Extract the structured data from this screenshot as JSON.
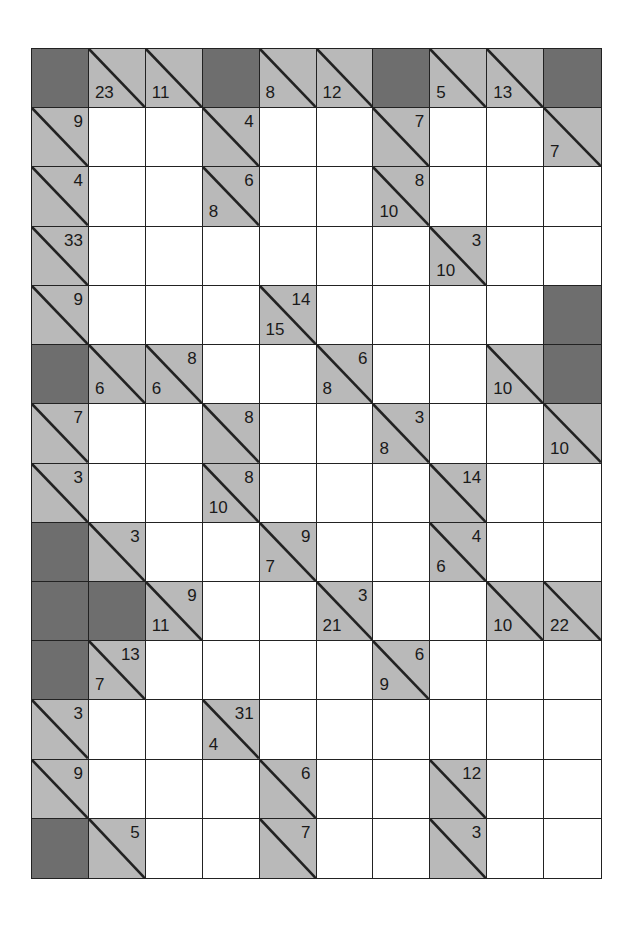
{
  "puzzle": {
    "type": "kakuro",
    "columns": 10,
    "rows": 14,
    "colors": {
      "block": "#6e6e6e",
      "clue": "#b9b9b9",
      "white": "#ffffff",
      "line": "#222222"
    },
    "legend": "Each cell: B = blocked, W = white entry cell, C = clue cell with optional 'r' (across sum, upper-right) and 'd' (down sum, lower-left)",
    "grid": [
      [
        {
          "t": "B"
        },
        {
          "t": "C",
          "d": "23"
        },
        {
          "t": "C",
          "d": "11"
        },
        {
          "t": "B"
        },
        {
          "t": "C",
          "d": "8"
        },
        {
          "t": "C",
          "d": "12"
        },
        {
          "t": "B"
        },
        {
          "t": "C",
          "d": "5"
        },
        {
          "t": "C",
          "d": "13"
        },
        {
          "t": "B"
        }
      ],
      [
        {
          "t": "C",
          "r": "9"
        },
        {
          "t": "W"
        },
        {
          "t": "W"
        },
        {
          "t": "C",
          "r": "4"
        },
        {
          "t": "W"
        },
        {
          "t": "W"
        },
        {
          "t": "C",
          "r": "7"
        },
        {
          "t": "W"
        },
        {
          "t": "W"
        },
        {
          "t": "C",
          "d": "7"
        }
      ],
      [
        {
          "t": "C",
          "r": "4"
        },
        {
          "t": "W"
        },
        {
          "t": "W"
        },
        {
          "t": "C",
          "r": "6",
          "d": "8"
        },
        {
          "t": "W"
        },
        {
          "t": "W"
        },
        {
          "t": "C",
          "r": "8",
          "d": "10"
        },
        {
          "t": "W"
        },
        {
          "t": "W"
        },
        {
          "t": "W"
        }
      ],
      [
        {
          "t": "C",
          "r": "33"
        },
        {
          "t": "W"
        },
        {
          "t": "W"
        },
        {
          "t": "W"
        },
        {
          "t": "W"
        },
        {
          "t": "W"
        },
        {
          "t": "W"
        },
        {
          "t": "C",
          "r": "3",
          "d": "10"
        },
        {
          "t": "W"
        },
        {
          "t": "W"
        }
      ],
      [
        {
          "t": "C",
          "r": "9"
        },
        {
          "t": "W"
        },
        {
          "t": "W"
        },
        {
          "t": "W"
        },
        {
          "t": "C",
          "r": "14",
          "d": "15"
        },
        {
          "t": "W"
        },
        {
          "t": "W"
        },
        {
          "t": "W"
        },
        {
          "t": "W"
        },
        {
          "t": "B"
        }
      ],
      [
        {
          "t": "B"
        },
        {
          "t": "C",
          "d": "6"
        },
        {
          "t": "C",
          "r": "8",
          "d": "6"
        },
        {
          "t": "W"
        },
        {
          "t": "W"
        },
        {
          "t": "C",
          "r": "6",
          "d": "8"
        },
        {
          "t": "W"
        },
        {
          "t": "W"
        },
        {
          "t": "C",
          "d": "10"
        },
        {
          "t": "B"
        }
      ],
      [
        {
          "t": "C",
          "r": "7"
        },
        {
          "t": "W"
        },
        {
          "t": "W"
        },
        {
          "t": "C",
          "r": "8"
        },
        {
          "t": "W"
        },
        {
          "t": "W"
        },
        {
          "t": "C",
          "r": "3",
          "d": "8"
        },
        {
          "t": "W"
        },
        {
          "t": "W"
        },
        {
          "t": "C",
          "d": "10"
        }
      ],
      [
        {
          "t": "C",
          "r": "3"
        },
        {
          "t": "W"
        },
        {
          "t": "W"
        },
        {
          "t": "C",
          "r": "8",
          "d": "10"
        },
        {
          "t": "W"
        },
        {
          "t": "W"
        },
        {
          "t": "W"
        },
        {
          "t": "C",
          "r": "14"
        },
        {
          "t": "W"
        },
        {
          "t": "W"
        }
      ],
      [
        {
          "t": "B"
        },
        {
          "t": "C",
          "r": "3"
        },
        {
          "t": "W"
        },
        {
          "t": "W"
        },
        {
          "t": "C",
          "r": "9",
          "d": "7"
        },
        {
          "t": "W"
        },
        {
          "t": "W"
        },
        {
          "t": "C",
          "r": "4",
          "d": "6"
        },
        {
          "t": "W"
        },
        {
          "t": "W"
        }
      ],
      [
        {
          "t": "B"
        },
        {
          "t": "B"
        },
        {
          "t": "C",
          "r": "9",
          "d": "11"
        },
        {
          "t": "W"
        },
        {
          "t": "W"
        },
        {
          "t": "C",
          "r": "3",
          "d": "21"
        },
        {
          "t": "W"
        },
        {
          "t": "W"
        },
        {
          "t": "C",
          "d": "10"
        },
        {
          "t": "C",
          "d": "22"
        }
      ],
      [
        {
          "t": "B"
        },
        {
          "t": "C",
          "r": "13",
          "d": "7"
        },
        {
          "t": "W"
        },
        {
          "t": "W"
        },
        {
          "t": "W"
        },
        {
          "t": "W"
        },
        {
          "t": "C",
          "r": "6",
          "d": "9"
        },
        {
          "t": "W"
        },
        {
          "t": "W"
        },
        {
          "t": "W"
        }
      ],
      [
        {
          "t": "C",
          "r": "3"
        },
        {
          "t": "W"
        },
        {
          "t": "W"
        },
        {
          "t": "C",
          "r": "31",
          "d": "4"
        },
        {
          "t": "W"
        },
        {
          "t": "W"
        },
        {
          "t": "W"
        },
        {
          "t": "W"
        },
        {
          "t": "W"
        },
        {
          "t": "W"
        }
      ],
      [
        {
          "t": "C",
          "r": "9"
        },
        {
          "t": "W"
        },
        {
          "t": "W"
        },
        {
          "t": "W"
        },
        {
          "t": "C",
          "r": "6"
        },
        {
          "t": "W"
        },
        {
          "t": "W"
        },
        {
          "t": "C",
          "r": "12"
        },
        {
          "t": "W"
        },
        {
          "t": "W"
        }
      ],
      [
        {
          "t": "B"
        },
        {
          "t": "C",
          "r": "5"
        },
        {
          "t": "W"
        },
        {
          "t": "W"
        },
        {
          "t": "C",
          "r": "7"
        },
        {
          "t": "W"
        },
        {
          "t": "W"
        },
        {
          "t": "C",
          "r": "3"
        },
        {
          "t": "W"
        },
        {
          "t": "W"
        }
      ]
    ]
  }
}
